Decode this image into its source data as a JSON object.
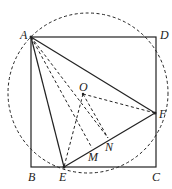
{
  "diagram": {
    "labels": {
      "A": "A",
      "B": "B",
      "C": "C",
      "D": "D",
      "E": "E",
      "F": "F",
      "O": "O",
      "M": "M",
      "N": "N"
    },
    "colors": {
      "line": "#222222",
      "background": "#ffffff"
    }
  }
}
